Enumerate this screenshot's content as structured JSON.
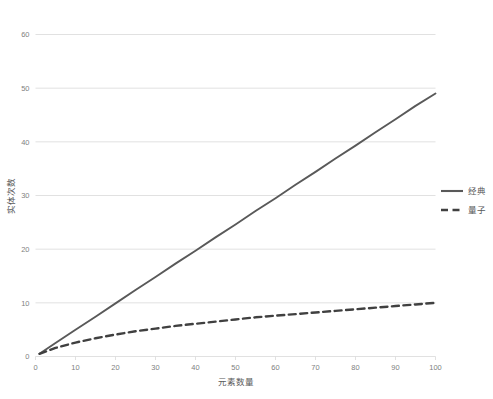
{
  "chart_data": {
    "type": "line",
    "title": "",
    "xlabel": "元素数量",
    "ylabel": "实体次数",
    "xlim": [
      0,
      100
    ],
    "ylim": [
      0,
      60
    ],
    "xticks": [
      "0",
      "10",
      "20",
      "30",
      "40",
      "50",
      "60",
      "70",
      "80",
      "90",
      "100"
    ],
    "yticks": [
      "0",
      "10",
      "20",
      "30",
      "40",
      "50",
      "60"
    ],
    "grid": "horizontal",
    "legend_position": "right",
    "x": [
      1,
      5,
      10,
      15,
      20,
      25,
      30,
      35,
      40,
      45,
      50,
      55,
      60,
      65,
      70,
      75,
      80,
      85,
      90,
      95,
      100
    ],
    "series": [
      {
        "name": "经典",
        "style": "solid",
        "color": "#595959",
        "values": [
          0.5,
          2.5,
          5.0,
          7.4,
          9.9,
          12.4,
          14.8,
          17.3,
          19.7,
          22.2,
          24.6,
          27.1,
          29.5,
          32.0,
          34.4,
          36.9,
          39.3,
          41.8,
          44.2,
          46.7,
          49.0
        ]
      },
      {
        "name": "量子",
        "style": "dashed",
        "color": "#404040",
        "values": [
          0.5,
          1.6,
          2.6,
          3.4,
          4.1,
          4.7,
          5.2,
          5.7,
          6.1,
          6.5,
          6.9,
          7.3,
          7.6,
          7.9,
          8.2,
          8.5,
          8.8,
          9.1,
          9.4,
          9.7,
          10.0
        ]
      }
    ]
  },
  "legend": {
    "items": [
      {
        "label": "经典",
        "style": "solid"
      },
      {
        "label": "量子",
        "style": "dashed"
      }
    ]
  }
}
